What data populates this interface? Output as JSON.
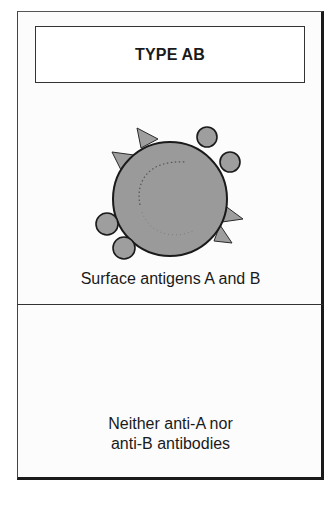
{
  "panel": {
    "title": "TYPE AB",
    "antigen_label": "Surface antigens A and B",
    "antibody_text": {
      "line1": "Neither anti-A nor",
      "line2": "anti-B antibodies"
    }
  },
  "cell": {
    "center": [
      170,
      199
    ],
    "radius": 57,
    "fill": "#9a9a9a",
    "stroke": "#1a1a1a"
  },
  "antigens": {
    "A_shape": "triangle",
    "B_shape": "circle",
    "fill": "#9e9e9e",
    "A_positions": [
      [
        148,
        137
      ],
      [
        125,
        158
      ],
      [
        236,
        215
      ],
      [
        230,
        236
      ]
    ],
    "B_positions": [
      [
        207,
        137
      ],
      [
        230,
        162
      ],
      [
        107,
        224
      ],
      [
        124,
        248
      ]
    ]
  },
  "colors": {
    "frame": "#1a1a1a",
    "background": "#ffffff",
    "cell_fill": "#9a9a9a"
  }
}
